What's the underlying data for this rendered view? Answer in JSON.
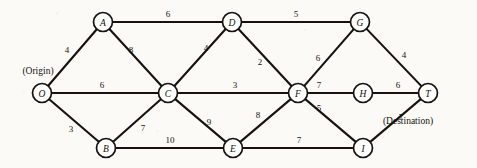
{
  "figure": {
    "kind": "undirected-weighted-network-diagram",
    "width": 477,
    "height": 168,
    "background_color": "#fbfaf7",
    "ink_color": "#15120f"
  },
  "chart_data": {
    "type": "diagram",
    "title": "",
    "xlabel": "",
    "ylabel": "",
    "grid": false,
    "legend": "none",
    "nodes": [
      {
        "id": "O",
        "label": "O",
        "x": 42,
        "y": 93,
        "r": 9.5,
        "annotation": "(Origin)"
      },
      {
        "id": "A",
        "label": "A",
        "x": 103,
        "y": 22,
        "r": 9.5,
        "annotation": ""
      },
      {
        "id": "B",
        "label": "B",
        "x": 106,
        "y": 148,
        "r": 9.5,
        "annotation": ""
      },
      {
        "id": "C",
        "label": "C",
        "x": 168,
        "y": 93,
        "r": 9.5,
        "annotation": ""
      },
      {
        "id": "D",
        "label": "D",
        "x": 232,
        "y": 22,
        "r": 9.5,
        "annotation": ""
      },
      {
        "id": "E",
        "label": "E",
        "x": 233,
        "y": 148,
        "r": 9.5,
        "annotation": ""
      },
      {
        "id": "F",
        "label": "F",
        "x": 298,
        "y": 93,
        "r": 9.5,
        "annotation": ""
      },
      {
        "id": "G",
        "label": "G",
        "x": 360,
        "y": 22,
        "r": 9.5,
        "annotation": ""
      },
      {
        "id": "H",
        "label": "H",
        "x": 363,
        "y": 93,
        "r": 9.5,
        "annotation": ""
      },
      {
        "id": "I",
        "label": "I",
        "x": 363,
        "y": 148,
        "r": 9.5,
        "annotation": ""
      },
      {
        "id": "T",
        "label": "T",
        "x": 428,
        "y": 93,
        "r": 9.5,
        "annotation": "(Destination)"
      }
    ],
    "edges": [
      {
        "from": "O",
        "to": "A",
        "weight": 4,
        "label_x": 67,
        "label_y": 50
      },
      {
        "from": "O",
        "to": "C",
        "weight": 6,
        "label_x": 102,
        "label_y": 85
      },
      {
        "from": "O",
        "to": "B",
        "weight": 3,
        "label_x": 71,
        "label_y": 129
      },
      {
        "from": "A",
        "to": "D",
        "weight": 6,
        "label_x": 168,
        "label_y": 14
      },
      {
        "from": "A",
        "to": "C",
        "weight": 8,
        "label_x": 131,
        "label_y": 50
      },
      {
        "from": "B",
        "to": "C",
        "weight": 7,
        "label_x": 143,
        "label_y": 128
      },
      {
        "from": "B",
        "to": "E",
        "weight": 10,
        "label_x": 170,
        "label_y": 140
      },
      {
        "from": "C",
        "to": "D",
        "weight": 4,
        "label_x": 206,
        "label_y": 48
      },
      {
        "from": "C",
        "to": "F",
        "weight": 3,
        "label_x": 235,
        "label_y": 85
      },
      {
        "from": "C",
        "to": "E",
        "weight": 9,
        "label_x": 209,
        "label_y": 122
      },
      {
        "from": "D",
        "to": "G",
        "weight": 5,
        "label_x": 296,
        "label_y": 14
      },
      {
        "from": "D",
        "to": "F",
        "weight": 2,
        "label_x": 260,
        "label_y": 62
      },
      {
        "from": "E",
        "to": "F",
        "weight": 8,
        "label_x": 258,
        "label_y": 115
      },
      {
        "from": "E",
        "to": "I",
        "weight": 7,
        "label_x": 299,
        "label_y": 140
      },
      {
        "from": "F",
        "to": "G",
        "weight": 6,
        "label_x": 318,
        "label_y": 58
      },
      {
        "from": "F",
        "to": "H",
        "weight": 7,
        "label_x": 319,
        "label_y": 85
      },
      {
        "from": "F",
        "to": "I",
        "weight": 5,
        "label_x": 319,
        "label_y": 108
      },
      {
        "from": "G",
        "to": "T",
        "weight": 4,
        "label_x": 404,
        "label_y": 55
      },
      {
        "from": "H",
        "to": "T",
        "weight": 6,
        "label_x": 398,
        "label_y": 85
      },
      {
        "from": "I",
        "to": "T",
        "weight": 7,
        "label_x": 401,
        "label_y": 117
      }
    ],
    "annotations": [
      {
        "name": "origin-annotation",
        "text": "(Origin)",
        "x": 38,
        "y": 71
      },
      {
        "name": "destination-annotation",
        "text": "(Destination)",
        "x": 408,
        "y": 121
      }
    ]
  }
}
